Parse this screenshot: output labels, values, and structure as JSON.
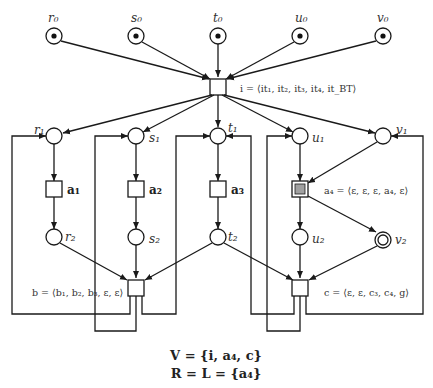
{
  "places": {
    "r0": {
      "label": "r₀",
      "marked": true
    },
    "s0": {
      "label": "s₀",
      "marked": true
    },
    "t0": {
      "label": "t₀",
      "marked": true
    },
    "u0": {
      "label": "u₀",
      "marked": true
    },
    "v0": {
      "label": "v₀",
      "marked": true
    },
    "r1": {
      "label": "r₁"
    },
    "s1": {
      "label": "s₁"
    },
    "t1": {
      "label": "t₁"
    },
    "u1": {
      "label": "u₁"
    },
    "v1": {
      "label": "v₁"
    },
    "r2": {
      "label": "r₂"
    },
    "s2": {
      "label": "s₂"
    },
    "t2": {
      "label": "t₂"
    },
    "u2": {
      "label": "u₂"
    },
    "v2": {
      "label": "v₂",
      "final": true
    }
  },
  "transitions": {
    "i": {
      "equation": "i = ⟨it₁, it₂, it₃, it₄, it_BT⟩"
    },
    "a1": {
      "label": "a₁"
    },
    "a2": {
      "label": "a₂"
    },
    "a3": {
      "label": "a₃"
    },
    "a4": {
      "equation": "a₄ = ⟨ε, ε, ε, a₄, ε⟩",
      "highlighted": true,
      "fill_color": "#a0a0a0"
    },
    "b": {
      "equation": "b = ⟨b₁, b₂, b₃, ε, ε⟩"
    },
    "c": {
      "equation": "c = ⟨ε, ε, c₃, c₄, g⟩"
    }
  },
  "footer": {
    "line1": "V = {i, a₄, c}",
    "line2": "R = L = {a₄}"
  }
}
